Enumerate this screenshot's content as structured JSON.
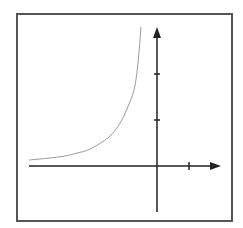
{
  "chart_data": {
    "type": "line",
    "title": "",
    "xlabel": "",
    "ylabel": "",
    "grid": false,
    "legend": null,
    "frame": {
      "x": 17,
      "y": 14,
      "width": 215,
      "height": 207,
      "stroke": "#555555"
    },
    "axes": {
      "origin_px": [
        157,
        166
      ],
      "x_axis": {
        "start_px": 29,
        "end_px": 221,
        "unit_px": 32,
        "ticks": [
          1
        ],
        "stroke": "#222222"
      },
      "y_axis": {
        "start_px": 212,
        "end_px": 27,
        "unit_px": 46,
        "ticks": [
          1,
          2
        ],
        "stroke": "#222222"
      }
    },
    "series": [
      {
        "name": "curve",
        "color": "#9a9a9a",
        "points_units": [
          [
            -4.0,
            0.13
          ],
          [
            -3.03,
            0.2
          ],
          [
            -2.5,
            0.28
          ],
          [
            -2.09,
            0.37
          ],
          [
            -1.5,
            0.63
          ],
          [
            -1.16,
            0.93
          ],
          [
            -0.94,
            1.24
          ],
          [
            -0.72,
            1.65
          ],
          [
            -0.6,
            2.2
          ],
          [
            -0.5,
            3.02
          ]
        ]
      }
    ],
    "xlim": [
      -4.0,
      2.0
    ],
    "ylim": [
      -1.0,
      3.0
    ]
  }
}
